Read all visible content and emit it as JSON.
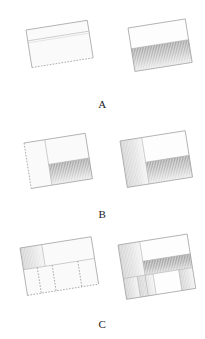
{
  "figure": {
    "title": "",
    "background_color": "#ffffff",
    "stroke_color": "#9a9a9a",
    "shade_dark": "#9e9e9e",
    "shade_light": "#f2f2f2",
    "rows": [
      {
        "label": "A",
        "label_y": 98,
        "panels": [
          {
            "name": "panel-a-left",
            "style": "outline",
            "x": 26,
            "y": 30,
            "w": 62,
            "h": 38,
            "rotate": -9,
            "dashed_edges": [
              "bottom"
            ],
            "cells": [
              {
                "name": "cell-a-left-top",
                "fill": "none",
                "x": 0,
                "y": 0,
                "w": 62,
                "h": 11
              },
              {
                "name": "cell-a-left-body",
                "fill": "none",
                "x": 0,
                "y": 11,
                "w": 62,
                "h": 27
              }
            ]
          },
          {
            "name": "panel-a-right",
            "style": "shaded",
            "x": 128,
            "y": 28,
            "w": 58,
            "h": 44,
            "rotate": -9,
            "dashed_edges": [],
            "cells": [
              {
                "name": "cell-a-right-upper",
                "fill": "white",
                "x": 0,
                "y": 0,
                "w": 58,
                "h": 21
              },
              {
                "name": "cell-a-right-lower",
                "fill": "gradient-v",
                "x": 0,
                "y": 21,
                "w": 58,
                "h": 23
              }
            ]
          }
        ]
      },
      {
        "label": "B",
        "label_y": 208,
        "panels": [
          {
            "name": "panel-b-left",
            "style": "outline",
            "x": 24,
            "y": 143,
            "w": 62,
            "h": 46,
            "rotate": -9,
            "dashed_edges": [
              "left"
            ],
            "cells": [
              {
                "name": "cell-b-left-column",
                "fill": "none",
                "x": 0,
                "y": 0,
                "w": 21,
                "h": 46
              },
              {
                "name": "cell-b-left-right-upper",
                "fill": "none",
                "x": 21,
                "y": 0,
                "w": 41,
                "h": 25
              },
              {
                "name": "cell-b-left-right-lower",
                "fill": "gradient-v",
                "x": 21,
                "y": 25,
                "w": 41,
                "h": 21
              }
            ]
          },
          {
            "name": "panel-b-right",
            "style": "shaded",
            "x": 120,
            "y": 141,
            "w": 66,
            "h": 47,
            "rotate": -9,
            "dashed_edges": [],
            "cells": [
              {
                "name": "cell-b-right-column",
                "fill": "gradient-h",
                "x": 0,
                "y": 0,
                "w": 22,
                "h": 47
              },
              {
                "name": "cell-b-right-right-upper",
                "fill": "white",
                "x": 22,
                "y": 0,
                "w": 44,
                "h": 25
              },
              {
                "name": "cell-b-right-right-lower",
                "fill": "gradient-v",
                "x": 22,
                "y": 25,
                "w": 44,
                "h": 22
              }
            ]
          }
        ]
      },
      {
        "label": "C",
        "label_y": 318,
        "panels": [
          {
            "name": "panel-c-left",
            "style": "outline",
            "x": 20,
            "y": 248,
            "w": 72,
            "h": 48,
            "rotate": -9,
            "dashed_edges": [
              "bottom"
            ],
            "cells": [
              {
                "name": "cell-c-left-top-left",
                "fill": "gradient-h",
                "x": 0,
                "y": 0,
                "w": 22,
                "h": 22
              },
              {
                "name": "cell-c-left-top-right",
                "fill": "none",
                "x": 22,
                "y": 0,
                "w": 50,
                "h": 22
              },
              {
                "name": "cell-c-left-bottom-1",
                "fill": "none",
                "x": 0,
                "y": 22,
                "w": 14,
                "h": 26
              },
              {
                "name": "cell-c-left-bottom-2",
                "fill": "none",
                "x": 14,
                "y": 22,
                "w": 15,
                "h": 26
              },
              {
                "name": "cell-c-left-bottom-3",
                "fill": "none",
                "x": 29,
                "y": 22,
                "w": 26,
                "h": 26
              },
              {
                "name": "cell-c-left-bottom-4",
                "fill": "none",
                "x": 55,
                "y": 22,
                "w": 17,
                "h": 26
              }
            ]
          },
          {
            "name": "panel-c-right",
            "style": "shaded",
            "x": 118,
            "y": 245,
            "w": 70,
            "h": 55,
            "rotate": -9,
            "dashed_edges": [],
            "cells": [
              {
                "name": "cell-c-right-left-col",
                "fill": "gradient-h",
                "x": 0,
                "y": 0,
                "w": 22,
                "h": 34
              },
              {
                "name": "cell-c-right-top-right",
                "fill": "white",
                "x": 22,
                "y": 0,
                "w": 48,
                "h": 20
              },
              {
                "name": "cell-c-right-mid-band",
                "fill": "gradient-v-dark",
                "x": 22,
                "y": 20,
                "w": 48,
                "h": 14
              },
              {
                "name": "cell-c-right-bottom-1",
                "fill": "gradient-h",
                "x": 0,
                "y": 34,
                "w": 14,
                "h": 21
              },
              {
                "name": "cell-c-right-bottom-2",
                "fill": "gradient-h",
                "x": 14,
                "y": 34,
                "w": 16,
                "h": 21
              },
              {
                "name": "cell-c-right-bottom-3",
                "fill": "white",
                "x": 30,
                "y": 34,
                "w": 26,
                "h": 21
              },
              {
                "name": "cell-c-right-bottom-4",
                "fill": "gradient-h",
                "x": 56,
                "y": 34,
                "w": 14,
                "h": 21
              }
            ]
          }
        ]
      }
    ]
  }
}
